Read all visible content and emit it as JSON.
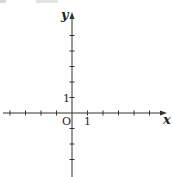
{
  "diagram": {
    "type": "cartesian-axes",
    "colors": {
      "axis": "#333333",
      "text": "#222222",
      "background": "#ffffff"
    },
    "origin_px": {
      "x": 72,
      "y": 113
    },
    "tick_spacing_px": 15.5,
    "x_axis": {
      "label": "x",
      "ticks_left": 4,
      "ticks_right": 5,
      "unit_label": "1",
      "extent_px": [
        3,
        167
      ]
    },
    "y_axis": {
      "label": "y",
      "ticks_up": 5,
      "ticks_down": 3,
      "unit_label": "1",
      "extent_px": [
        12,
        177
      ]
    },
    "origin_label": "O"
  }
}
